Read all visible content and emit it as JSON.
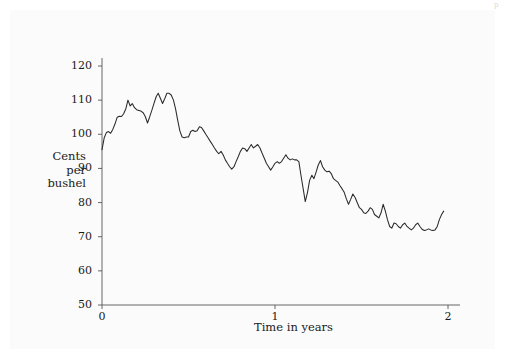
{
  "figure": {
    "background_color": "#fbfbfb",
    "line_color": "#2a2a2a",
    "axis_color": "#555555",
    "corner_mark": "p"
  },
  "labels": {
    "ylabel_line1": "Cents",
    "ylabel_line2": "per",
    "ylabel_line3": "bushel",
    "xlabel": "Time in years"
  },
  "chart_data": {
    "type": "line",
    "title": "",
    "xlabel": "Time in years",
    "ylabel": "Cents per bushel",
    "xlim": [
      0,
      2
    ],
    "ylim": [
      50,
      120
    ],
    "grid": false,
    "legend": null,
    "xticks": [
      0,
      1,
      2
    ],
    "xticklabels": [
      "0",
      "1",
      "2"
    ],
    "yticks": [
      50,
      60,
      70,
      80,
      90,
      100,
      110,
      120
    ],
    "yticklabels": [
      "50",
      "60",
      "70",
      "80",
      "90",
      "100",
      "110",
      "120"
    ],
    "series": [
      {
        "name": "price",
        "x": [
          0.0,
          0.013,
          0.025,
          0.038,
          0.05,
          0.063,
          0.075,
          0.088,
          0.1,
          0.113,
          0.125,
          0.138,
          0.15,
          0.163,
          0.175,
          0.188,
          0.2,
          0.213,
          0.225,
          0.238,
          0.25,
          0.263,
          0.275,
          0.288,
          0.3,
          0.313,
          0.325,
          0.338,
          0.35,
          0.363,
          0.375,
          0.388,
          0.4,
          0.413,
          0.425,
          0.438,
          0.45,
          0.463,
          0.475,
          0.488,
          0.5,
          0.513,
          0.525,
          0.538,
          0.55,
          0.563,
          0.575,
          0.588,
          0.6,
          0.613,
          0.625,
          0.638,
          0.65,
          0.663,
          0.675,
          0.688,
          0.7,
          0.713,
          0.725,
          0.738,
          0.75,
          0.763,
          0.775,
          0.788,
          0.8,
          0.813,
          0.825,
          0.838,
          0.85,
          0.863,
          0.875,
          0.888,
          0.9,
          0.913,
          0.925,
          0.938,
          0.95,
          0.963,
          0.975,
          0.988,
          1.0,
          1.013,
          1.025,
          1.038,
          1.05,
          1.063,
          1.075,
          1.088,
          1.1,
          1.113,
          1.125,
          1.138,
          1.15,
          1.163,
          1.175,
          1.188,
          1.2,
          1.213,
          1.225,
          1.238,
          1.25,
          1.263,
          1.275,
          1.288,
          1.3,
          1.313,
          1.325,
          1.338,
          1.35,
          1.363,
          1.375,
          1.388,
          1.4,
          1.413,
          1.425,
          1.438,
          1.45,
          1.463,
          1.475,
          1.488,
          1.5,
          1.513,
          1.525,
          1.538,
          1.55,
          1.563,
          1.575,
          1.588,
          1.6,
          1.613,
          1.625,
          1.638,
          1.65,
          1.663,
          1.675,
          1.688,
          1.7,
          1.713,
          1.725,
          1.738,
          1.75,
          1.763,
          1.775,
          1.788,
          1.8,
          1.813,
          1.825,
          1.838,
          1.85,
          1.863,
          1.875,
          1.888,
          1.9,
          1.913,
          1.925,
          1.938,
          1.95,
          1.963,
          1.975
        ],
        "y": [
          95.5,
          99.0,
          100.5,
          100.8,
          100.3,
          101.5,
          103.0,
          105.0,
          105.3,
          105.2,
          106.0,
          107.5,
          110.0,
          108.3,
          109.0,
          107.8,
          107.2,
          107.0,
          106.8,
          106.3,
          105.2,
          103.3,
          105.0,
          107.0,
          109.0,
          111.0,
          112.0,
          110.5,
          109.0,
          110.5,
          112.0,
          112.0,
          111.5,
          110.0,
          107.5,
          104.0,
          101.0,
          99.2,
          99.0,
          99.2,
          99.2,
          100.8,
          101.2,
          100.8,
          101.0,
          102.2,
          102.0,
          101.0,
          100.0,
          99.0,
          98.0,
          97.0,
          96.0,
          95.0,
          94.3,
          95.0,
          94.0,
          92.5,
          91.5,
          90.5,
          89.8,
          90.5,
          92.0,
          93.5,
          95.0,
          96.0,
          95.8,
          95.0,
          96.0,
          97.0,
          96.0,
          96.5,
          97.0,
          96.0,
          94.5,
          93.0,
          91.5,
          90.5,
          89.5,
          90.5,
          91.5,
          92.0,
          91.5,
          92.0,
          93.0,
          94.0,
          93.0,
          92.5,
          92.8,
          92.5,
          92.5,
          92.0,
          88.0,
          84.0,
          80.3,
          83.0,
          86.5,
          88.0,
          87.0,
          89.0,
          91.0,
          92.3,
          90.5,
          89.5,
          89.0,
          89.2,
          88.5,
          87.0,
          86.5,
          86.0,
          85.0,
          84.0,
          83.0,
          81.0,
          79.5,
          81.0,
          82.5,
          81.5,
          80.0,
          78.5,
          78.0,
          77.0,
          76.8,
          77.5,
          78.5,
          78.0,
          76.5,
          76.0,
          75.5,
          77.0,
          79.5,
          77.5,
          75.0,
          73.0,
          72.5,
          74.0,
          73.8,
          73.0,
          72.5,
          73.5,
          74.0,
          73.0,
          72.5,
          72.0,
          72.5,
          73.5,
          74.0,
          73.0,
          72.2,
          71.8,
          72.0,
          72.3,
          72.0,
          71.8,
          72.0,
          73.0,
          75.0,
          76.5,
          77.5
        ]
      }
    ]
  }
}
